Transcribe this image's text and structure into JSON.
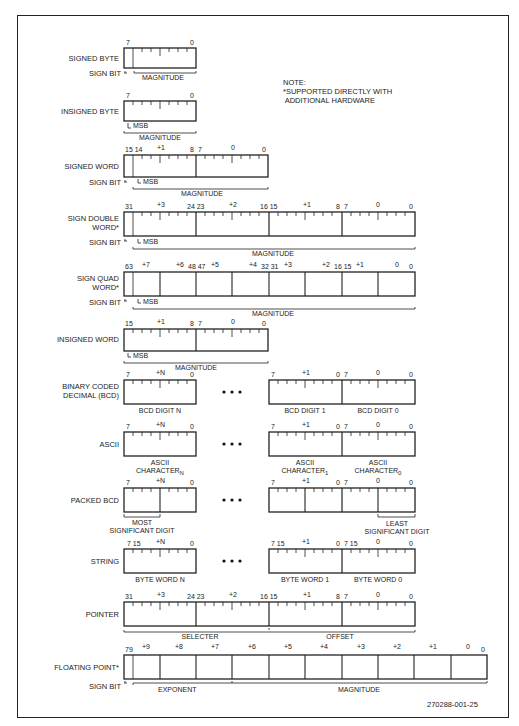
{
  "figure": {
    "note": "NOTE:\n*SUPPORTED DIRECTLY WITH\n ADDITIONAL HARDWARE",
    "figure_id": "270288-001-25",
    "common": {
      "sign_bit": "SIGN BIT",
      "msb": "MSB",
      "magnitude": "MAGNITUDE",
      "ellipsis": "• • •"
    },
    "types": [
      {
        "name": "SIGNED BYTE",
        "bits": [
          "7",
          "0"
        ]
      },
      {
        "name": "INSIGNED BYTE",
        "bits": [
          "7",
          "0"
        ]
      },
      {
        "name": "SIGNED WORD",
        "bits": [
          "15 14",
          "+1",
          "8",
          "7",
          "0",
          "0"
        ]
      },
      {
        "name": "SIGN DOUBLE\nWORD*",
        "line1": "SIGN DOUBLE",
        "line2": "WORD*",
        "bits": [
          "31",
          "+3",
          "24 23",
          "+2",
          "16 15",
          "+1",
          "8",
          "7",
          "0",
          "0"
        ]
      },
      {
        "name": "SIGN QUAD\nWORD*",
        "line1": "SIGN QUAD",
        "line2": "WORD*",
        "bits": [
          "63",
          "+7",
          "+6",
          "48 47",
          "+5",
          "+4",
          "32 31",
          "+3",
          "+2",
          "16 15",
          "+1",
          "0",
          "0"
        ]
      },
      {
        "name": "INSIGNED WORD",
        "bits": [
          "15",
          "+1",
          "8",
          "7",
          "0",
          "0"
        ]
      },
      {
        "name": "BINARY CODED\nDECIMAL (BCD)",
        "line1": "BINARY CODED",
        "line2": "DECIMAL (BCD)",
        "captions": [
          "BCD DIGIT N",
          "BCD DIGIT 1",
          "BCD DIGIT 0"
        ]
      },
      {
        "name": "ASCII",
        "captions_line1": [
          "ASCII",
          "ASCII",
          "ASCII"
        ],
        "captions_line2": [
          "CHARACTER",
          "CHARACTER",
          "CHARACTER"
        ],
        "subscripts": [
          "N",
          "1",
          "0"
        ]
      },
      {
        "name": "PACKED BCD",
        "captions": [
          "MOST",
          "SIGNIFICANT DIGIT",
          "LEAST",
          "SIGNIFICANT DIGIT"
        ]
      },
      {
        "name": "STRING",
        "captions": [
          "BYTE WORD N",
          "BYTE WORD 1",
          "BYTE WORD 0"
        ]
      },
      {
        "name": "POINTER",
        "captions": [
          "SELECTER",
          "OFFSET"
        ]
      },
      {
        "name": "FLOATING POINT*",
        "bits": [
          "79",
          "+9",
          "+8",
          "+7",
          "+6",
          "+5",
          "+4",
          "+3",
          "+2",
          "+1",
          "0",
          "0"
        ],
        "captions": [
          "EXPONENT",
          "MAGNITUDE"
        ]
      }
    ],
    "offset_labels": {
      "n": "+N",
      "p1": "+1",
      "z": "0",
      "seven": "7",
      "zero": "0",
      "seven15": "7 15"
    }
  }
}
